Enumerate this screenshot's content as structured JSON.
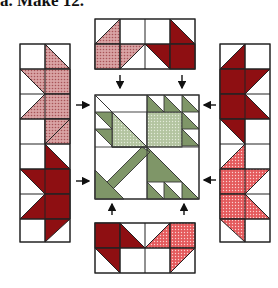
{
  "caption": "a. Make 12.",
  "colors": {
    "dark_red": "#8e0f12",
    "light_red_print": "#c98a8c",
    "bright_red_print": "#e0484b",
    "green_dark": "#7f9668",
    "green_light_print": "#b7c7a4",
    "outline": "#222222",
    "background": "#ffffff"
  },
  "diagram": {
    "center_block": "Green flower block (center)",
    "units": [
      "top-unit",
      "bottom-unit",
      "left-unit",
      "right-unit"
    ],
    "arrows": 8
  }
}
